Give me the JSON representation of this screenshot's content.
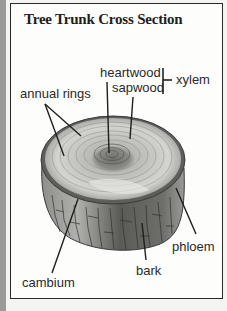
{
  "title": "Tree Trunk Cross Section",
  "labels": {
    "heartwood": "heartwood",
    "sapwood": "sapwood",
    "xylem": "xylem",
    "annual_rings": "annual rings",
    "phloem": "phloem",
    "bark": "bark",
    "cambium": "cambium"
  },
  "colors": {
    "frame_border": "#2a2a2a",
    "background": "#fdfdfb",
    "bark_dark": "#4a4a4a",
    "wood_light": "#d8d8d4",
    "heartwood": "#7a7a76"
  }
}
